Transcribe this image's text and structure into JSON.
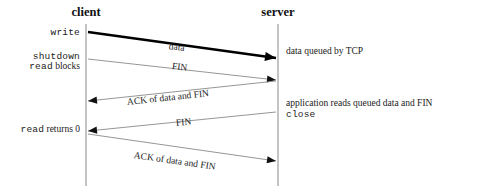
{
  "diagram": {
    "title_clipped": "figure header",
    "width": 479,
    "height": 189,
    "colors": {
      "line": "#8a8a8a",
      "bold_line": "#000000",
      "text": "#1a1a1a",
      "background": "#ffffff"
    },
    "lifelines": [
      {
        "id": "client",
        "label": "client",
        "x": 86,
        "top": 24,
        "bottom": 186
      },
      {
        "id": "server",
        "label": "server",
        "x": 278,
        "top": 24,
        "bottom": 186
      }
    ],
    "left_labels": [
      {
        "id": "write",
        "text": "write",
        "style": "mono",
        "x": 80,
        "y": 33
      },
      {
        "id": "shutdown",
        "text": "shutdown",
        "style": "mono",
        "x": 80,
        "y": 57
      },
      {
        "id": "read-blocks",
        "text": "read blocks",
        "style": "mixed",
        "mono_part": "read",
        "serif_part": " blocks",
        "x": 80,
        "y": 67
      },
      {
        "id": "read-returns-0",
        "text": "read returns 0",
        "style": "mixed",
        "mono_part": "read",
        "serif_part": " returns 0",
        "x": 80,
        "y": 130
      }
    ],
    "right_labels": [
      {
        "id": "data-queued",
        "text": "data queued by TCP",
        "style": "serif",
        "x": 286,
        "y": 52
      },
      {
        "id": "application-reads",
        "text": "application reads queued data and FIN",
        "style": "serif",
        "x": 286,
        "y": 104
      },
      {
        "id": "close",
        "text": "close",
        "style": "mono",
        "x": 286,
        "y": 115
      }
    ],
    "messages": [
      {
        "id": "data",
        "label": "data",
        "direction": "client-to-server",
        "bold": true,
        "x1": 88,
        "y1": 32,
        "x2": 276,
        "y2": 58,
        "label_x": 169,
        "label_y": 41,
        "label_rot": 7.9
      },
      {
        "id": "fin-1",
        "label": "FIN",
        "direction": "client-to-server",
        "bold": false,
        "x1": 88,
        "y1": 59,
        "x2": 276,
        "y2": 80,
        "label_x": 172,
        "label_y": 61,
        "label_rot": 6.4
      },
      {
        "id": "ack-of-data-and-fin-1",
        "label": "ACK of data and FIN",
        "direction": "server-to-client",
        "bold": false,
        "x1": 276,
        "y1": 81,
        "x2": 88,
        "y2": 101,
        "label_x": 127,
        "label_y": 97,
        "label_rot": -6.2
      },
      {
        "id": "fin-2",
        "label": "FIN",
        "direction": "server-to-client",
        "bold": false,
        "x1": 276,
        "y1": 112,
        "x2": 88,
        "y2": 131,
        "label_x": 176,
        "label_y": 118,
        "label_rot": -6.0
      },
      {
        "id": "ack-of-data-and-fin-2",
        "label": "ACK of data and FIN",
        "direction": "client-to-server",
        "bold": false,
        "x1": 88,
        "y1": 134,
        "x2": 276,
        "y2": 161,
        "label_x": 134,
        "label_y": 150,
        "label_rot": 8.2
      }
    ]
  }
}
